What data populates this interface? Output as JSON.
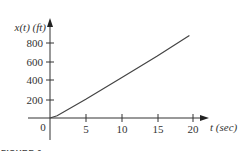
{
  "chart_data": {
    "type": "line",
    "title": "",
    "xlabel": "t (sec)",
    "ylabel": "x(t) (ft)",
    "x_ticks": [
      "0",
      "5",
      "10",
      "15",
      "20"
    ],
    "y_ticks": [
      "200",
      "400",
      "600",
      "800"
    ],
    "origin_label": "0",
    "xlim": [
      0,
      21
    ],
    "ylim": [
      0,
      900
    ],
    "grid": false,
    "series": [
      {
        "name": "x(t)",
        "x": [
          0,
          1,
          5,
          10,
          15,
          19.5
        ],
        "values": [
          0,
          25,
          200,
          430,
          660,
          880
        ]
      }
    ]
  },
  "caption": "FIGURE 6"
}
